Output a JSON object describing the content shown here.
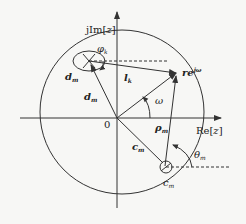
{
  "diagram": {
    "type": "z-plane geometry",
    "axes": {
      "imag_label_prefix": "jIm[",
      "imag_label_var": "z",
      "imag_label_suffix": "]",
      "real_label_prefix": "Re[",
      "real_label_var": "z",
      "real_label_suffix": "]",
      "origin_label": "0"
    },
    "labels": {
      "phi": "φ",
      "phi_sub": "k",
      "d_small": "d",
      "d_small_sub": "m",
      "d_vec": "d",
      "d_vec_sub": "m",
      "l": "l",
      "l_sub": "k",
      "point": "re",
      "point_sup": "jω",
      "omega": "ω",
      "rho": "ρ",
      "rho_sub": "m",
      "c_vec": "c",
      "c_vec_sub": "m",
      "theta": "θ",
      "theta_sub": "m",
      "c_small": "c",
      "c_small_sub": "m"
    },
    "colors": {
      "stroke": "#333333",
      "background": "#f7f7f5"
    }
  }
}
